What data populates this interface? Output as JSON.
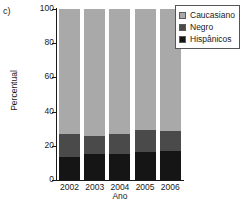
{
  "panel": {
    "label": "c)"
  },
  "legend": {
    "position": "top-right",
    "entries": [
      {
        "label": "Caucasiano",
        "color": "#a9a9a9"
      },
      {
        "label": "Negro",
        "color": "#4a4a4a"
      },
      {
        "label": "Hispânicos",
        "color": "#151515"
      }
    ]
  },
  "axes": {
    "ylabel": "Percentual",
    "xlabel": "Ano",
    "yticks": [
      "0",
      "20",
      "40",
      "60",
      "80",
      "100"
    ]
  },
  "chart_data": {
    "type": "bar",
    "subtype": "stacked-100-percent",
    "title": "",
    "xlabel": "Ano",
    "ylabel": "Percentual",
    "categories": [
      "2002",
      "2003",
      "2004",
      "2005",
      "2006"
    ],
    "ylim": [
      0,
      100
    ],
    "ytick_values": [
      0,
      20,
      40,
      60,
      80,
      100
    ],
    "grid": false,
    "legend_position": "top-right",
    "series": [
      {
        "name": "Hispânicos",
        "color": "#151515",
        "values": [
          13.5,
          15.0,
          15.0,
          16.5,
          17.0
        ]
      },
      {
        "name": "Negro",
        "color": "#4a4a4a",
        "values": [
          13.5,
          11.0,
          12.0,
          12.5,
          11.5
        ]
      },
      {
        "name": "Caucasiano",
        "color": "#a9a9a9",
        "values": [
          73.0,
          74.0,
          73.0,
          71.0,
          71.5
        ]
      }
    ],
    "cumulative_tops": {
      "Hispânicos": [
        13.5,
        15.0,
        15.0,
        16.5,
        17.0
      ],
      "Negro": [
        27.0,
        26.0,
        27.0,
        29.0,
        28.5
      ],
      "Caucasiano": [
        100,
        100,
        100,
        100,
        100
      ]
    }
  }
}
